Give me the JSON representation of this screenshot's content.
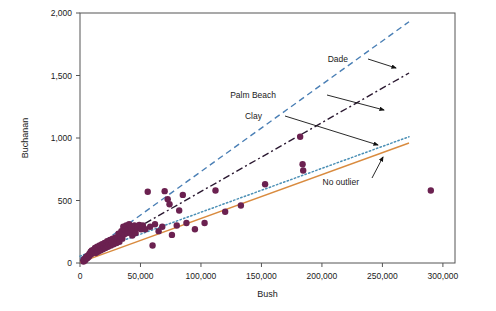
{
  "chart_data": {
    "type": "scatter",
    "title": "",
    "xlabel": "Bush",
    "ylabel": "Buchanan",
    "xlim": [
      0,
      310000
    ],
    "ylim": [
      0,
      2000
    ],
    "grid": false,
    "legend_position": "inline-annotations",
    "x_ticks": [
      0,
      50000,
      100000,
      150000,
      200000,
      250000,
      300000
    ],
    "x_tick_labels": [
      "0",
      "50,000",
      "100,000",
      "150,000",
      "200,000",
      "250,000",
      "300,000"
    ],
    "y_ticks": [
      0,
      500,
      1000,
      1500,
      2000
    ],
    "y_tick_labels": [
      "0",
      "500",
      "1,000",
      "1,500",
      "2,000"
    ],
    "point_color": "#6B2150",
    "points": [
      {
        "x": 2873,
        "y": 12
      },
      {
        "x": 3000,
        "y": 25
      },
      {
        "x": 3500,
        "y": 30
      },
      {
        "x": 4200,
        "y": 20
      },
      {
        "x": 4800,
        "y": 45
      },
      {
        "x": 5300,
        "y": 35
      },
      {
        "x": 5800,
        "y": 55
      },
      {
        "x": 6200,
        "y": 40
      },
      {
        "x": 6800,
        "y": 60
      },
      {
        "x": 7300,
        "y": 50
      },
      {
        "x": 7800,
        "y": 75
      },
      {
        "x": 8200,
        "y": 65
      },
      {
        "x": 8800,
        "y": 90
      },
      {
        "x": 9300,
        "y": 70
      },
      {
        "x": 9800,
        "y": 100
      },
      {
        "x": 10500,
        "y": 85
      },
      {
        "x": 11200,
        "y": 105
      },
      {
        "x": 11800,
        "y": 95
      },
      {
        "x": 12400,
        "y": 120
      },
      {
        "x": 13000,
        "y": 80
      },
      {
        "x": 13600,
        "y": 110
      },
      {
        "x": 14200,
        "y": 130
      },
      {
        "x": 14900,
        "y": 90
      },
      {
        "x": 15500,
        "y": 115
      },
      {
        "x": 16200,
        "y": 140
      },
      {
        "x": 16900,
        "y": 100
      },
      {
        "x": 17500,
        "y": 125
      },
      {
        "x": 18200,
        "y": 150
      },
      {
        "x": 18900,
        "y": 110
      },
      {
        "x": 19600,
        "y": 135
      },
      {
        "x": 20300,
        "y": 160
      },
      {
        "x": 21000,
        "y": 120
      },
      {
        "x": 21800,
        "y": 145
      },
      {
        "x": 22500,
        "y": 175
      },
      {
        "x": 23200,
        "y": 130
      },
      {
        "x": 24000,
        "y": 155
      },
      {
        "x": 24800,
        "y": 185
      },
      {
        "x": 25500,
        "y": 140
      },
      {
        "x": 26300,
        "y": 165
      },
      {
        "x": 27000,
        "y": 195
      },
      {
        "x": 27800,
        "y": 150
      },
      {
        "x": 28600,
        "y": 180
      },
      {
        "x": 29400,
        "y": 205
      },
      {
        "x": 30200,
        "y": 160
      },
      {
        "x": 31000,
        "y": 190
      },
      {
        "x": 31800,
        "y": 235
      },
      {
        "x": 32600,
        "y": 170
      },
      {
        "x": 33400,
        "y": 215
      },
      {
        "x": 34200,
        "y": 255
      },
      {
        "x": 35000,
        "y": 195
      },
      {
        "x": 35800,
        "y": 290
      },
      {
        "x": 36600,
        "y": 230
      },
      {
        "x": 37400,
        "y": 265
      },
      {
        "x": 38200,
        "y": 300
      },
      {
        "x": 39000,
        "y": 240
      },
      {
        "x": 39800,
        "y": 275
      },
      {
        "x": 40600,
        "y": 310
      },
      {
        "x": 41500,
        "y": 250
      },
      {
        "x": 42300,
        "y": 285
      },
      {
        "x": 43200,
        "y": 220
      },
      {
        "x": 44000,
        "y": 265
      },
      {
        "x": 45000,
        "y": 300
      },
      {
        "x": 46000,
        "y": 240
      },
      {
        "x": 47500,
        "y": 280
      },
      {
        "x": 49000,
        "y": 305
      },
      {
        "x": 50500,
        "y": 270
      },
      {
        "x": 52000,
        "y": 300
      },
      {
        "x": 54000,
        "y": 270
      },
      {
        "x": 56000,
        "y": 570
      },
      {
        "x": 58000,
        "y": 290
      },
      {
        "x": 60000,
        "y": 140
      },
      {
        "x": 62000,
        "y": 310
      },
      {
        "x": 65000,
        "y": 255
      },
      {
        "x": 68000,
        "y": 290
      },
      {
        "x": 70000,
        "y": 575
      },
      {
        "x": 72500,
        "y": 510
      },
      {
        "x": 74000,
        "y": 470
      },
      {
        "x": 76000,
        "y": 225
      },
      {
        "x": 80000,
        "y": 300
      },
      {
        "x": 82000,
        "y": 420
      },
      {
        "x": 85000,
        "y": 545
      },
      {
        "x": 88000,
        "y": 320
      },
      {
        "x": 95000,
        "y": 270
      },
      {
        "x": 103000,
        "y": 320
      },
      {
        "x": 112000,
        "y": 580
      },
      {
        "x": 120000,
        "y": 410
      },
      {
        "x": 133000,
        "y": 460
      },
      {
        "x": 153000,
        "y": 630
      },
      {
        "x": 182000,
        "y": 1010
      },
      {
        "x": 184000,
        "y": 790
      },
      {
        "x": 184500,
        "y": 740
      },
      {
        "x": 290000,
        "y": 580
      }
    ],
    "lines": [
      {
        "name": "Dade",
        "label": "Dade",
        "style": "dashed",
        "color": "#4A7FB5",
        "x0": 0,
        "y0": 35,
        "x1": 272000,
        "y1": 1930
      },
      {
        "name": "Palm Beach",
        "label": "Palm Beach",
        "style": "dash-dot",
        "color": "#2A1830",
        "x0": 0,
        "y0": 20,
        "x1": 272000,
        "y1": 1520
      },
      {
        "name": "Clay",
        "label": "Clay",
        "style": "dotted",
        "color": "#4A8FB5",
        "x0": 0,
        "y0": 55,
        "x1": 272000,
        "y1": 1010
      },
      {
        "name": "No outlier",
        "label": "No outlier",
        "style": "solid",
        "color": "#D98B3F",
        "x0": 0,
        "y0": 5,
        "x1": 272000,
        "y1": 960
      }
    ],
    "annotations": [
      {
        "label": "Dade",
        "text_x": 348,
        "text_y": 62,
        "arrow_from_x": 368,
        "arrow_from_y": 59,
        "arrow_to_x": 396,
        "arrow_to_y": 68
      },
      {
        "label": "Palm Beach",
        "text_x": 276,
        "text_y": 98,
        "arrow_from_x": 327,
        "arrow_from_y": 95,
        "arrow_to_x": 384,
        "arrow_to_y": 110
      },
      {
        "label": "Clay",
        "text_x": 262,
        "text_y": 119,
        "arrow_from_x": 285,
        "arrow_from_y": 116,
        "arrow_to_x": 378,
        "arrow_to_y": 145
      },
      {
        "label": "No outlier",
        "text_x": 359,
        "text_y": 185,
        "arrow_from_x": 372,
        "arrow_from_y": 178,
        "arrow_to_x": 383,
        "arrow_to_y": 157
      }
    ]
  }
}
